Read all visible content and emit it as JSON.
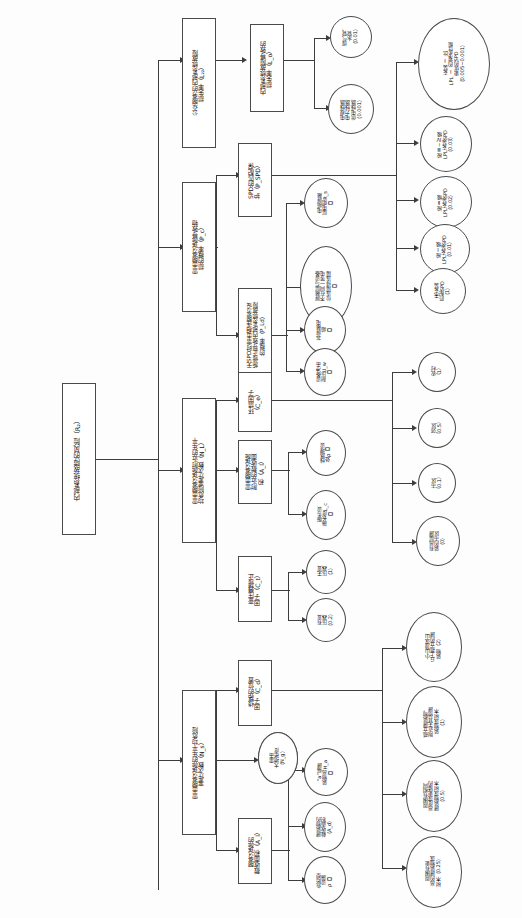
{
  "diagram": {
    "orientation": "text rotated 90 degrees counter-clockwise",
    "root": {
      "id": "root",
      "label": "内部系统故障的风险（R₂）"
    },
    "level1": [
      {
        "id": "L2",
        "label": "公众服务的内部系统故障\n损失率（L₂₂）"
      },
      {
        "id": "Pc",
        "label": "雷击服务设施导致物\n损的概率（P_c）"
      },
      {
        "id": "NL",
        "label": "雷击服务设施附近的年平\n均危险事件次数（N_L）"
      },
      {
        "id": "Ns",
        "label": "雷击服务设施的年平均危险\n事件次数（N_s）"
      }
    ],
    "level2": [
      {
        "id": "Lo",
        "label": "内部系统故障导致的\n损失率（L_o）"
      },
      {
        "id": "Pspd",
        "label": "SPD的匹配保\n护（P_SPD）"
      },
      {
        "id": "Pld",
        "label": "无SPD时雷击相连服务设\n施修正导致内部系统故障\n的概率（P_Ld）"
      },
      {
        "id": "Ce",
        "label": "环境因子\n（C_e）"
      },
      {
        "id": "Al",
        "label": "雷击服务设施\n附近的截收面\n积（A_l）"
      },
      {
        "id": "Ct",
        "label": "变压器修正\n因子（C_t）"
      },
      {
        "id": "Cd",
        "label": "线路的位置\n因子（C_d）"
      },
      {
        "id": "Ng2",
        "label": "雷击\n大地密度\n（N_g）"
      },
      {
        "id": "Al2",
        "label": "服务设施的\n截收面积（A_l）"
      }
    ],
    "leaves": [
      {
        "id": "gas",
        "label": "煤气管、\n水管\n（0.01）"
      },
      {
        "id": "powerline",
        "label": "电视线路\n电力线路\n供电线路\n（0.001）"
      },
      {
        "id": "shield_rs",
        "label": "电缆屏蔽\n层电阻R_s\n【】"
      },
      {
        "id": "shield_bond",
        "label": "屏蔽层与设备\n不在同一等电\n位连接排连接\n【】"
      },
      {
        "id": "unshielded",
        "label": "非屏蔽电\n缆\n【】"
      },
      {
        "id": "uw",
        "label": "设备冲击\n耐压U_w\n【】"
      },
      {
        "id": "rho",
        "label": "线路埋设\n处ρ【】"
      },
      {
        "id": "Lc",
        "label": "服务设\n施长度L_c\n【】"
      },
      {
        "id": "spd_best",
        "label": "安装 Ⅰ 比\nLPL Ⅰ 的要求性能\n更优的SPD\n（0.005~0.001）"
      },
      {
        "id": "spd34",
        "label": "按Ⅲ~Ⅳ级\nLPL安装SPD\n（0.03）"
      },
      {
        "id": "spd2",
        "label": "按Ⅱ级\nLPL安装SPD\n（0.02）"
      },
      {
        "id": "spd1",
        "label": "按Ⅰ级\nLPL安装SPD\n（0.01）"
      },
      {
        "id": "spd_none",
        "label": "未安装\n匹配SPD\n（1）"
      },
      {
        "id": "rural",
        "label": "农村\n（1）"
      },
      {
        "id": "suburb",
        "label": "郊区\n（0.5）"
      },
      {
        "id": "urban",
        "label": "市区\n（0.1）"
      },
      {
        "id": "urban_tall",
        "label": "有高层建\n筑的市区\n（0）"
      },
      {
        "id": "no_transformer",
        "label": "无变\n压器\n（1）"
      },
      {
        "id": "has_transformer",
        "label": "有变\n压器\n（0.2）"
      },
      {
        "id": "hill_isolated",
        "label": "小山顶或山\n丘上孤立的建\n筑物（2）"
      },
      {
        "id": "isolated",
        "label": "孤立建筑物，\n附近无其他建\n筑物或树木\n（1）"
      },
      {
        "id": "same_height",
        "label": "周围有相同\n高度或更矮的\n建筑物或树木\n（0.5）"
      },
      {
        "id": "taller",
        "label": "周围有更\n高的建筑物或\n树木（0.25）"
      },
      {
        "id": "Ng",
        "label": "雷击\n大地密度\n（N_g）"
      },
      {
        "id": "Ha",
        "label": "“a”端建\n筑物高H_a\n【】"
      },
      {
        "id": "Ad",
        "label": "建筑物的\n截收面积\n（A_d）"
      },
      {
        "id": "Pb",
        "label": "危险型\n设施\nρ【】"
      }
    ],
    "colors": {
      "stroke": "#4a4a4a",
      "edge": "#3d3d3d",
      "text": "#111111",
      "background": "#ffffff"
    }
  }
}
